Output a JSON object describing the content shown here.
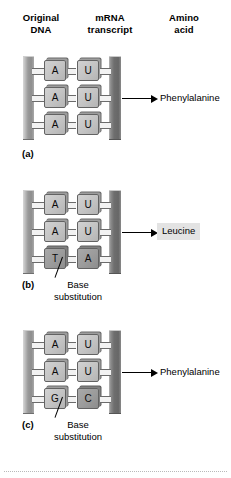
{
  "headers": {
    "dna": {
      "line1": "Original",
      "line2": "DNA"
    },
    "mrna": {
      "line1": "mRNA",
      "line2": "transcript"
    },
    "amino": {
      "line1": "Amino",
      "line2": "acid"
    }
  },
  "panels": [
    {
      "letter": "(a)",
      "pairs": [
        {
          "dna": "A",
          "mrna": "U",
          "dna_dark": false,
          "mrna_dark": false
        },
        {
          "dna": "A",
          "mrna": "U",
          "dna_dark": false,
          "mrna_dark": false
        },
        {
          "dna": "A",
          "mrna": "U",
          "dna_dark": false,
          "mrna_dark": false
        }
      ],
      "amino_acid": "Phenylalanine",
      "amino_boxed": false,
      "callout": null
    },
    {
      "letter": "(b)",
      "pairs": [
        {
          "dna": "A",
          "mrna": "U",
          "dna_dark": false,
          "mrna_dark": false
        },
        {
          "dna": "A",
          "mrna": "U",
          "dna_dark": false,
          "mrna_dark": false
        },
        {
          "dna": "T",
          "mrna": "A",
          "dna_dark": true,
          "mrna_dark": true
        }
      ],
      "amino_acid": "Leucine",
      "amino_boxed": true,
      "callout": {
        "line1": "Base",
        "line2": "substitution"
      }
    },
    {
      "letter": "(c)",
      "pairs": [
        {
          "dna": "A",
          "mrna": "U",
          "dna_dark": false,
          "mrna_dark": false
        },
        {
          "dna": "A",
          "mrna": "U",
          "dna_dark": false,
          "mrna_dark": false
        },
        {
          "dna": "G",
          "mrna": "C",
          "dna_dark": false,
          "mrna_dark": true
        }
      ],
      "amino_acid": "Phenylalanine",
      "amino_boxed": false,
      "callout": {
        "line1": "Base",
        "line2": "substitution"
      }
    }
  ],
  "colors": {
    "backbone_dna": "#9a9a9a",
    "backbone_mrna": "#6e6e6e",
    "nucleotide": "#c3c3c3",
    "nucleotide_dark": "#9b9b9b",
    "highlight_box": "#e3e3e3"
  }
}
